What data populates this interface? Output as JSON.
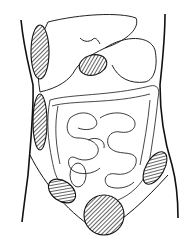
{
  "figure": {
    "colors": {
      "stroke": "#111111",
      "background": "#ffffff",
      "hatch": "#222222"
    },
    "hatched_regions": [
      {
        "id": "right-upper-flank",
        "cx": 40,
        "cy": 52,
        "rx": 9,
        "ry": 27
      },
      {
        "id": "gallbladder-region",
        "cx": 93,
        "cy": 65,
        "rx": 14,
        "ry": 10
      },
      {
        "id": "right-mid-flank",
        "cx": 40,
        "cy": 122,
        "rx": 7,
        "ry": 28
      },
      {
        "id": "left-lower-quadrant",
        "cx": 155,
        "cy": 168,
        "rx": 9,
        "ry": 18
      },
      {
        "id": "right-lower-quadrant",
        "cx": 62,
        "cy": 191,
        "rx": 15,
        "ry": 10
      },
      {
        "id": "suprapubic",
        "cx": 104,
        "cy": 215,
        "rx": 20,
        "ry": 21
      }
    ]
  }
}
